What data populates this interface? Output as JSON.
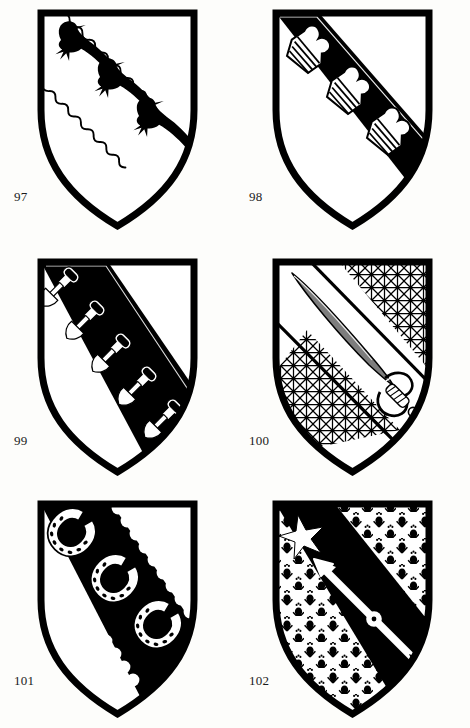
{
  "page": {
    "kind": "heraldry-plate",
    "background_color": "#fdfdfb",
    "ink_color": "#000000",
    "field_color": "#ffffff",
    "columns": 2,
    "rows": 3
  },
  "shields": [
    {
      "number": "97",
      "caption": "97",
      "row": 0,
      "column": 0,
      "field_tincture": "argent",
      "blazon": "Argent, a bend cotised wavy between three ravens sable",
      "charges": [
        {
          "name": "raven",
          "count": 3,
          "tincture": "sable",
          "arrangement": "in bend sinister"
        },
        {
          "name": "bend-wavy-lines",
          "count": 2,
          "tincture": "outline",
          "arrangement": "bendwise"
        }
      ],
      "charge_label": "three ravens and a wavy cotised bend"
    },
    {
      "number": "98",
      "caption": "98",
      "row": 0,
      "column": 1,
      "field_tincture": "argent",
      "blazon": "Argent, on a bend sable three wool-packs argent",
      "charges": [
        {
          "name": "bend",
          "count": 1,
          "tincture": "sable",
          "arrangement": "bendwise"
        },
        {
          "name": "wool-pack",
          "count": 3,
          "tincture": "argent",
          "arrangement": "in bend"
        }
      ],
      "charge_label": "three wool-packs on a black bend"
    },
    {
      "number": "99",
      "caption": "99",
      "row": 1,
      "column": 0,
      "field_tincture": "argent",
      "blazon": "Argent, on a bend sable five spades argent",
      "charges": [
        {
          "name": "bend",
          "count": 1,
          "tincture": "sable",
          "arrangement": "bendwise"
        },
        {
          "name": "spade",
          "count": 5,
          "tincture": "argent",
          "arrangement": "in bend"
        }
      ],
      "charge_label": "five spades on a broad black bend"
    },
    {
      "number": "100",
      "caption": "100",
      "row": 1,
      "column": 1,
      "field_tincture": "fretty",
      "blazon": "Fretty, on a bend argent a sabre proper",
      "charges": [
        {
          "name": "bend",
          "count": 1,
          "tincture": "argent",
          "arrangement": "bendwise"
        },
        {
          "name": "sabre",
          "count": 1,
          "tincture": "proper",
          "arrangement": "in bend, point to chief"
        },
        {
          "name": "fretty-diaper",
          "count": 1,
          "tincture": "hatched",
          "arrangement": "field"
        }
      ],
      "charge_label": "a sabre on a white bend over a fretty field"
    },
    {
      "number": "101",
      "caption": "101",
      "row": 2,
      "column": 0,
      "field_tincture": "argent",
      "blazon": "Argent, on a bend engrailed sable three horseshoes argent",
      "charges": [
        {
          "name": "bend-engrailed",
          "count": 1,
          "tincture": "sable",
          "arrangement": "bendwise"
        },
        {
          "name": "horseshoe",
          "count": 3,
          "tincture": "argent",
          "arrangement": "in bend"
        }
      ],
      "charge_label": "three horseshoes on an engrailed black bend"
    },
    {
      "number": "102",
      "caption": "102",
      "row": 2,
      "column": 1,
      "field_tincture": "ermine",
      "blazon": "Ermine, on a bend sable an arrow argent, in chief a mullet argent",
      "charges": [
        {
          "name": "bend",
          "count": 1,
          "tincture": "sable",
          "arrangement": "bendwise"
        },
        {
          "name": "arrow",
          "count": 1,
          "tincture": "argent",
          "arrangement": "in bend, point to chief"
        },
        {
          "name": "mullet",
          "count": 1,
          "tincture": "argent",
          "arrangement": "in chief dexter"
        },
        {
          "name": "ermine-spot",
          "count": 34,
          "tincture": "sable",
          "arrangement": "semy"
        }
      ],
      "charge_label": "an arrow and a star on a black bend, ermine field"
    }
  ]
}
